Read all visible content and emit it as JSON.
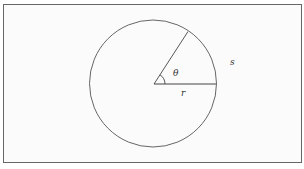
{
  "diagram": {
    "type": "circle-arc-length",
    "labels": {
      "angle": "θ",
      "radius": "r",
      "arc": "s"
    },
    "colors": {
      "stroke": "#555555",
      "frame": "#666666",
      "background": "#ffffff"
    }
  }
}
